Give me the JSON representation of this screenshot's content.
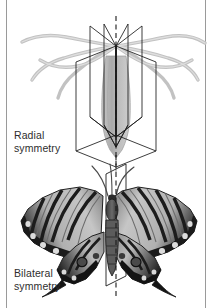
{
  "figure": {
    "title_radial": "Radial\nsymmetry",
    "title_bilateral": "Bilateral\nsymmetry",
    "colors": {
      "background": "#ffffff",
      "border_rule": "#9a9a9a",
      "caption_text": "#2e2e2e",
      "plane_line": "#1a1a1a",
      "axis_dashed": "#1a1a1a",
      "hydra_body": "#b9b9b9",
      "hydra_tentacle": "#c4c4c4",
      "butterfly_dark": "#1c1c1c",
      "butterfly_mid": "#6e6e6e",
      "butterfly_light": "#d2d2d2"
    },
    "panels": [
      {
        "name": "radial-symmetry-panel",
        "organism": "hydra",
        "caption": "Radial\nsymmetry",
        "symmetry_planes": 5,
        "axis_type": "dashed-vertical"
      },
      {
        "name": "bilateral-symmetry-panel",
        "organism": "swallowtail-butterfly",
        "caption": "Bilateral\nsymmetry",
        "symmetry_planes": 1,
        "axis_type": "dashed-vertical"
      }
    ]
  }
}
